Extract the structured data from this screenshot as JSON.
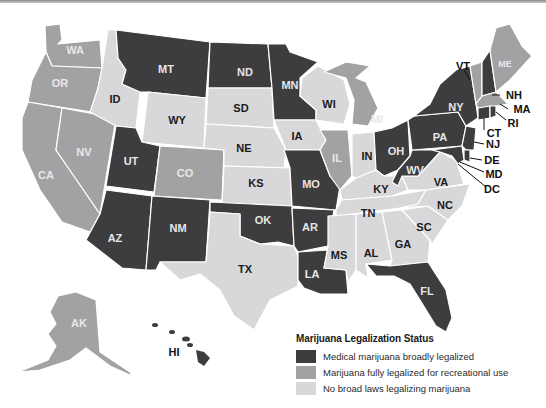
{
  "colors": {
    "medical": "#3d3d3f",
    "recreational": "#a2a2a4",
    "none": "#d8d8da"
  },
  "legend": {
    "title": "Marijuana Legalization Status",
    "items": [
      {
        "key": "medical",
        "label": "Medical marijuana broadly legalized"
      },
      {
        "key": "recreational",
        "label": "Marijuana fully legalized for recreational use"
      },
      {
        "key": "none",
        "label": "No broad laws legalizing marijuana"
      }
    ]
  },
  "states": {
    "WA": {
      "label": "WA",
      "status": "recreational"
    },
    "OR": {
      "label": "OR",
      "status": "recreational"
    },
    "CA": {
      "label": "CA",
      "status": "recreational"
    },
    "NV": {
      "label": "NV",
      "status": "recreational"
    },
    "ID": {
      "label": "ID",
      "status": "none"
    },
    "MT": {
      "label": "MT",
      "status": "medical"
    },
    "WY": {
      "label": "WY",
      "status": "none"
    },
    "UT": {
      "label": "UT",
      "status": "medical"
    },
    "CO": {
      "label": "CO",
      "status": "recreational"
    },
    "AZ": {
      "label": "AZ",
      "status": "medical"
    },
    "NM": {
      "label": "NM",
      "status": "medical"
    },
    "ND": {
      "label": "ND",
      "status": "medical"
    },
    "SD": {
      "label": "SD",
      "status": "none"
    },
    "NE": {
      "label": "NE",
      "status": "none"
    },
    "KS": {
      "label": "KS",
      "status": "none"
    },
    "OK": {
      "label": "OK",
      "status": "medical"
    },
    "TX": {
      "label": "TX",
      "status": "none"
    },
    "MN": {
      "label": "MN",
      "status": "medical"
    },
    "IA": {
      "label": "IA",
      "status": "none"
    },
    "MO": {
      "label": "MO",
      "status": "medical"
    },
    "AR": {
      "label": "AR",
      "status": "medical"
    },
    "LA": {
      "label": "LA",
      "status": "medical"
    },
    "WI": {
      "label": "WI",
      "status": "none"
    },
    "IL": {
      "label": "IL",
      "status": "recreational"
    },
    "MI": {
      "label": "MI",
      "status": "recreational"
    },
    "IN": {
      "label": "IN",
      "status": "none"
    },
    "OH": {
      "label": "OH",
      "status": "medical"
    },
    "KY": {
      "label": "KY",
      "status": "none"
    },
    "TN": {
      "label": "TN",
      "status": "none"
    },
    "MS": {
      "label": "MS",
      "status": "none"
    },
    "AL": {
      "label": "AL",
      "status": "none"
    },
    "GA": {
      "label": "GA",
      "status": "none"
    },
    "FL": {
      "label": "FL",
      "status": "medical"
    },
    "SC": {
      "label": "SC",
      "status": "none"
    },
    "NC": {
      "label": "NC",
      "status": "none"
    },
    "VA": {
      "label": "VA",
      "status": "none"
    },
    "WV": {
      "label": "WV",
      "status": "medical"
    },
    "PA": {
      "label": "PA",
      "status": "medical"
    },
    "NY": {
      "label": "NY",
      "status": "medical"
    },
    "VT": {
      "label": "VT",
      "status": "recreational"
    },
    "NH": {
      "label": "NH",
      "status": "medical"
    },
    "ME": {
      "label": "ME",
      "status": "recreational"
    },
    "MA": {
      "label": "MA",
      "status": "recreational"
    },
    "RI": {
      "label": "RI",
      "status": "medical"
    },
    "CT": {
      "label": "CT",
      "status": "medical"
    },
    "NJ": {
      "label": "NJ",
      "status": "medical"
    },
    "DE": {
      "label": "DE",
      "status": "medical"
    },
    "MD": {
      "label": "MD",
      "status": "medical"
    },
    "DC": {
      "label": "DC",
      "status": "recreational"
    },
    "AK": {
      "label": "AK",
      "status": "recreational"
    },
    "HI": {
      "label": "HI",
      "status": "medical"
    }
  }
}
